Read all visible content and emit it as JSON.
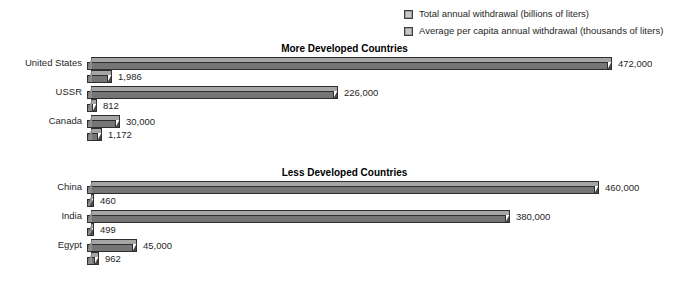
{
  "legend": {
    "items": [
      {
        "label": "Total annual withdrawal (billions of liters)",
        "swatch_color": "#9c9c9c",
        "series": "total"
      },
      {
        "label": "Average per capita annual withdrawal (thousands of liters)",
        "swatch_color": "#9c9c9c",
        "series": "per_capita"
      }
    ]
  },
  "sections": [
    {
      "title": "More Developed Countries",
      "rows": [
        {
          "country": "United States",
          "total_label": "472,000",
          "capita_label": "1,986",
          "total": 472000,
          "per_capita": 1986
        },
        {
          "country": "USSR",
          "total_label": "226,000",
          "capita_label": "812",
          "total": 226000,
          "per_capita": 812
        },
        {
          "country": "Canada",
          "total_label": "30,000",
          "capita_label": "1,172",
          "total": 30000,
          "per_capita": 1172
        }
      ]
    },
    {
      "title": "Less Developed Countries",
      "rows": [
        {
          "country": "China",
          "total_label": "460,000",
          "capita_label": "460",
          "total": 460000,
          "per_capita": 460
        },
        {
          "country": "India",
          "total_label": "380,000",
          "capita_label": "499",
          "total": 380000,
          "per_capita": 499
        },
        {
          "country": "Egypt",
          "total_label": "45,000",
          "capita_label": "962",
          "total": 45000,
          "per_capita": 962
        }
      ]
    }
  ],
  "chart_data": {
    "type": "bar",
    "title": "",
    "orientation": "horizontal",
    "grid": false,
    "legend_position": "top-right",
    "xlabel": "",
    "ylabel": "",
    "groups": [
      "More Developed Countries",
      "Less Developed Countries"
    ],
    "categories": [
      "United States",
      "USSR",
      "Canada",
      "China",
      "India",
      "Egypt"
    ],
    "series": [
      {
        "name": "Total annual withdrawal (billions of liters)",
        "unit": "billions of liters",
        "color": "#757575",
        "values": [
          472000,
          226000,
          30000,
          460000,
          380000,
          45000
        ],
        "value_labels": [
          "472,000",
          "226,000",
          "30,000",
          "460,000",
          "380,000",
          "45,000"
        ],
        "max": 472000
      },
      {
        "name": "Average per capita annual withdrawal (thousands of liters)",
        "unit": "thousands of liters",
        "color": "#757575",
        "values": [
          1986,
          812,
          1172,
          460,
          499,
          962
        ],
        "value_labels": [
          "1,986",
          "812",
          "1,172",
          "460",
          "499",
          "962"
        ],
        "max": 1986
      }
    ]
  },
  "scale": {
    "bar_origin_x": 87,
    "total_pixels_per_unit": 0.001112,
    "capita_pixels_per_unit": 0.0128,
    "min_bar_px": 7
  },
  "colors": {
    "bar_top": "#a5a5a5",
    "bar_front": "#757575",
    "bar_cap": "#4a4a4a",
    "outline": "#2e2e2e",
    "text": "#1f1f1f",
    "background": "#ffffff"
  }
}
